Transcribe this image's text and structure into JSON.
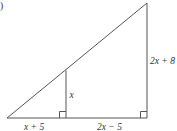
{
  "figure": {
    "marker": ")",
    "labels": {
      "left_base": "x + 5",
      "right_base": "2x − 5",
      "inner_height": "x",
      "outer_height": "2x + 8"
    },
    "geometry": {
      "outer_triangle": "right triangle with right angle at bottom-right",
      "inner_triangle": "similar right triangle with right angle at inner foot",
      "right_angles": 2
    },
    "colors": {
      "stroke": "#555555",
      "text": "#333333",
      "background": "#ffffff"
    }
  }
}
